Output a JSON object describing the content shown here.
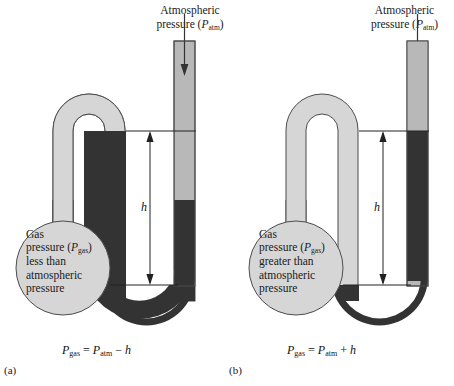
{
  "figure": {
    "type": "diagram",
    "colors": {
      "mercury": "#333333",
      "glass_tube": "#b8b8b8",
      "glass_tube_light": "#d6d6d6",
      "outline": "#555555",
      "background": "#ffffff",
      "text": "#1a1a1a"
    }
  },
  "panels": [
    {
      "key": "a",
      "panel_label": "(a)",
      "atmospheric_label_line1": "Atmospheric",
      "atmospheric_label_line2_prefix": "pressure (",
      "atmospheric_label_symbol": "P",
      "atmospheric_label_subscript": "atm",
      "atmospheric_label_line2_suffix": ")",
      "bulb_line1": "Gas",
      "bulb_line2_prefix": "pressure (",
      "bulb_symbol": "P",
      "bulb_subscript": "gas",
      "bulb_line2_suffix": ")",
      "bulb_line3": "less than",
      "bulb_line4": "atmospheric",
      "bulb_line5": "pressure",
      "height_label": "h",
      "formula": {
        "lhs_symbol": "P",
        "lhs_subscript": "gas",
        "equals": " = ",
        "rhs_symbol": "P",
        "rhs_subscript": "atm",
        "operator": " − ",
        "term": "h"
      }
    },
    {
      "key": "b",
      "panel_label": "(b)",
      "atmospheric_label_line1": "Atmospheric",
      "atmospheric_label_line2_prefix": "pressure (",
      "atmospheric_label_symbol": "P",
      "atmospheric_label_subscript": "atm",
      "atmospheric_label_line2_suffix": ")",
      "bulb_line1": "Gas",
      "bulb_line2_prefix": "pressure (",
      "bulb_symbol": "P",
      "bulb_subscript": "gas",
      "bulb_line2_suffix": ")",
      "bulb_line3": "greater than",
      "bulb_line4": "atmospheric",
      "bulb_line5": "pressure",
      "height_label": "h",
      "formula": {
        "lhs_symbol": "P",
        "lhs_subscript": "gas",
        "equals": " = ",
        "rhs_symbol": "P",
        "rhs_subscript": "atm",
        "operator": " + ",
        "term": "h"
      }
    }
  ]
}
